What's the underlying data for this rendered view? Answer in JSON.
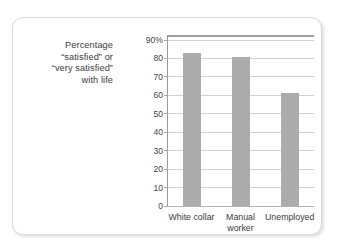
{
  "chart_data": {
    "type": "bar",
    "title": "",
    "subtitle": "",
    "xlabel": "",
    "ylabel": "Percentage “satisfied” or “very satisfied” with life",
    "ylabel_lines": [
      "Percentage",
      "“satisfied” or",
      "“very satisfied”",
      "with life"
    ],
    "categories": [
      "White collar",
      "Manual worker",
      "Unemployed"
    ],
    "category_lines": [
      [
        "White collar"
      ],
      [
        "Manual",
        "worker"
      ],
      [
        "Unemployed"
      ]
    ],
    "values": [
      83,
      81,
      61
    ],
    "ylim": [
      0,
      90
    ],
    "ytick_values": [
      0,
      10,
      20,
      30,
      40,
      50,
      60,
      70,
      80,
      90
    ],
    "ytick_labels": [
      "0",
      "10",
      "20",
      "30",
      "40",
      "50",
      "60",
      "70",
      "80",
      "90%"
    ],
    "units": "percent",
    "grid": true,
    "legend": false,
    "legend_position": "none",
    "bar_color": "#abacac",
    "gridline_color": "#d2d2d2",
    "axis_color": "#9a9a9a",
    "text_color": "#3b3b3b",
    "frame_border_color": "#d9d9d9",
    "background_color": "#ffffff"
  }
}
